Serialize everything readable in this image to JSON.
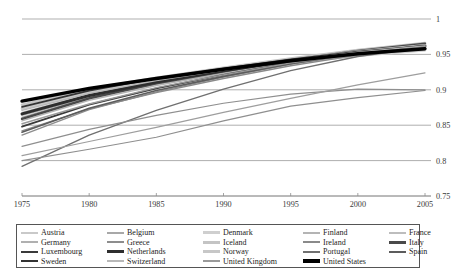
{
  "chart_data": {
    "type": "line",
    "title": "",
    "subtitle": "",
    "xlabel": "",
    "ylabel": "",
    "xlim": [
      1975,
      2005
    ],
    "ylim": [
      0.75,
      1.0
    ],
    "grid": true,
    "grid_axis": "y",
    "y_axis_position": "right",
    "x_ticks": [
      1975,
      1980,
      1985,
      1990,
      1995,
      2000,
      2005
    ],
    "x_tick_labels": [
      "1975",
      "1980",
      "1985",
      "1990",
      "1995",
      "2000",
      "2005"
    ],
    "y_ticks": [
      0.75,
      0.8,
      0.85,
      0.9,
      0.95,
      1
    ],
    "y_tick_labels": [
      "0.75",
      "0.8",
      "0.85",
      "0.9",
      "0.95",
      "1"
    ],
    "x": [
      1975,
      1980,
      1985,
      1990,
      1995,
      2000,
      2005
    ],
    "legend_position": "bottom",
    "legend_columns": 5,
    "series": [
      {
        "name": "Austria",
        "color": "#c9c9c9",
        "width": 1.4,
        "values": [
          0.868,
          0.894,
          0.913,
          0.928,
          0.942,
          0.954,
          0.963
        ]
      },
      {
        "name": "Belgium",
        "color": "#a8a8a8",
        "width": 1.4,
        "values": [
          0.861,
          0.889,
          0.909,
          0.925,
          0.94,
          0.952,
          0.961
        ]
      },
      {
        "name": "Denmark",
        "color": "#cfcfcf",
        "width": 2.6,
        "values": [
          0.873,
          0.896,
          0.912,
          0.926,
          0.938,
          0.948,
          0.956
        ]
      },
      {
        "name": "Finland",
        "color": "#b4b4b4",
        "width": 1.4,
        "values": [
          0.856,
          0.885,
          0.906,
          0.923,
          0.939,
          0.953,
          0.963
        ]
      },
      {
        "name": "France",
        "color": "#bdbdbd",
        "width": 1.6,
        "values": [
          0.866,
          0.893,
          0.912,
          0.928,
          0.943,
          0.956,
          0.966
        ]
      },
      {
        "name": "Germany",
        "color": "#b0b0b0",
        "width": 1.4,
        "values": [
          0.864,
          0.889,
          0.908,
          0.923,
          0.937,
          0.949,
          0.957
        ]
      },
      {
        "name": "Greece",
        "color": "#8d8d8d",
        "width": 1.4,
        "values": [
          0.836,
          0.872,
          0.897,
          0.918,
          0.936,
          0.951,
          0.962
        ]
      },
      {
        "name": "Iceland",
        "color": "#c4c4c4",
        "width": 2.6,
        "values": [
          0.879,
          0.901,
          0.917,
          0.931,
          0.944,
          0.956,
          0.966
        ]
      },
      {
        "name": "Ireland",
        "color": "#8a8a8a",
        "width": 1.4,
        "values": [
          0.842,
          0.873,
          0.896,
          0.916,
          0.934,
          0.949,
          0.96
        ]
      },
      {
        "name": "Italy",
        "color": "#4a4a4a",
        "width": 2.4,
        "values": [
          0.859,
          0.888,
          0.909,
          0.926,
          0.942,
          0.955,
          0.965
        ]
      },
      {
        "name": "Luxembourg",
        "color": "#3a3a3a",
        "width": 1.8,
        "values": [
          0.848,
          0.879,
          0.902,
          0.921,
          0.938,
          0.952,
          0.962
        ]
      },
      {
        "name": "Netherlands",
        "color": "#2e2e2e",
        "width": 3.0,
        "values": [
          0.866,
          0.892,
          0.911,
          0.927,
          0.941,
          0.953,
          0.962
        ]
      },
      {
        "name": "Norway",
        "color": "#c7c7c7",
        "width": 2.6,
        "values": [
          0.874,
          0.898,
          0.915,
          0.929,
          0.942,
          0.954,
          0.963
        ]
      },
      {
        "name": "Portugal",
        "color": "#707070",
        "width": 1.4,
        "values": [
          0.792,
          0.836,
          0.871,
          0.901,
          0.927,
          0.947,
          0.96
        ]
      },
      {
        "name": "Spain",
        "color": "#5c5c5c",
        "width": 1.6,
        "values": [
          0.84,
          0.874,
          0.899,
          0.919,
          0.937,
          0.952,
          0.963
        ]
      },
      {
        "name": "Sweden",
        "color": "#333333",
        "width": 1.8,
        "values": [
          0.876,
          0.899,
          0.916,
          0.93,
          0.943,
          0.954,
          0.962
        ]
      },
      {
        "name": "Switzerland",
        "color": "#b8b8b8",
        "width": 1.4,
        "values": [
          0.871,
          0.895,
          0.913,
          0.928,
          0.941,
          0.953,
          0.962
        ]
      },
      {
        "name": "United Kingdom",
        "color": "#9a9a9a",
        "width": 1.4,
        "values": [
          0.852,
          0.88,
          0.903,
          0.921,
          0.938,
          0.951,
          0.961
        ]
      },
      {
        "name": "United States",
        "color": "#000000",
        "width": 3.4,
        "values": [
          0.884,
          0.902,
          0.916,
          0.929,
          0.941,
          0.951,
          0.958
        ]
      },
      {
        "name": "series-low-1",
        "color": "#8f8f8f",
        "width": 1.2,
        "values": [
          0.82,
          0.844,
          0.864,
          0.881,
          0.894,
          0.901,
          0.9
        ],
        "hidden_from_legend": true
      },
      {
        "name": "series-low-2",
        "color": "#9e9e9e",
        "width": 1.2,
        "values": [
          0.807,
          0.827,
          0.847,
          0.868,
          0.888,
          0.907,
          0.924
        ],
        "hidden_from_legend": true
      },
      {
        "name": "series-low-3",
        "color": "#8f8f8f",
        "width": 1.2,
        "values": [
          0.8,
          0.816,
          0.833,
          0.856,
          0.877,
          0.889,
          0.899
        ],
        "hidden_from_legend": true
      }
    ]
  },
  "legend": {
    "rows": [
      [
        {
          "label": "Austria",
          "color": "#c9c9c9",
          "width": 1.6
        },
        {
          "label": "Belgium",
          "color": "#a8a8a8",
          "width": 1.6
        },
        {
          "label": "Denmark",
          "color": "#cfcfcf",
          "width": 3.0
        },
        {
          "label": "Finland",
          "color": "#b4b4b4",
          "width": 1.6
        },
        {
          "label": "France",
          "color": "#bdbdbd",
          "width": 1.8
        }
      ],
      [
        {
          "label": "Germany",
          "color": "#b0b0b0",
          "width": 1.6
        },
        {
          "label": "Greece",
          "color": "#8d8d8d",
          "width": 1.6
        },
        {
          "label": "Iceland",
          "color": "#c4c4c4",
          "width": 3.0
        },
        {
          "label": "Ireland",
          "color": "#8a8a8a",
          "width": 1.6
        },
        {
          "label": "Italy",
          "color": "#4a4a4a",
          "width": 2.8
        }
      ],
      [
        {
          "label": "Luxembourg",
          "color": "#3a3a3a",
          "width": 2.0
        },
        {
          "label": "Netherlands",
          "color": "#2e2e2e",
          "width": 3.4
        },
        {
          "label": "Norway",
          "color": "#c7c7c7",
          "width": 3.0
        },
        {
          "label": "Portugal",
          "color": "#707070",
          "width": 1.6
        },
        {
          "label": "Spain",
          "color": "#5c5c5c",
          "width": 1.8
        }
      ],
      [
        {
          "label": "Sweden",
          "color": "#333333",
          "width": 2.0
        },
        {
          "label": "Switzerland",
          "color": "#b8b8b8",
          "width": 1.6
        },
        {
          "label": "United Kingdom",
          "color": "#9a9a9a",
          "width": 1.6
        },
        {
          "label": "United States",
          "color": "#000000",
          "width": 4.2
        },
        {
          "label": "",
          "color": "#ffffff",
          "width": 0,
          "empty": true
        }
      ]
    ]
  },
  "style": {
    "grid_color": "#8d8d8d",
    "axis_color": "#8d8d8d",
    "legend_border": "#555555",
    "background": "#ffffff"
  }
}
